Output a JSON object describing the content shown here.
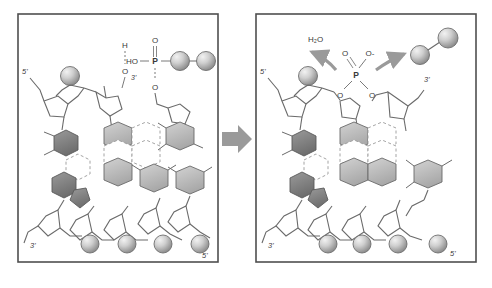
{
  "figure": {
    "type": "diagram",
    "background_color": "#ffffff",
    "panel_border_color": "#4f4f4f",
    "transition_arrow": {
      "name": "reaction-arrow",
      "direction": "right",
      "color": "#9a9a9a"
    }
  },
  "panels": [
    {
      "id": "before",
      "labels": {
        "template_5prime_top": "5'",
        "primer_3prime_oh": "3'",
        "template_3prime_bottom": "3'",
        "strand_5prime_bottom": "5'"
      },
      "hydroxyl": {
        "hydrogen": "H",
        "oxygen": "O"
      },
      "incoming_nucleotide": {
        "hydroxyl_label": "HO",
        "phosphorus": "P",
        "oxygen_double_bond": "O",
        "oxygen_ester": "O",
        "phosphate_spheres": 2
      }
    },
    {
      "id": "after",
      "labels": {
        "template_5prime_top": "5'",
        "new_3prime_end": "3'",
        "template_3prime_bottom": "3'",
        "strand_5prime_bottom": "5'"
      },
      "released_products": {
        "water": "H₂O",
        "pyrophosphate_spheres": 2
      },
      "phosphodiester": {
        "phosphorus": "P",
        "oxygen_double_bond": "O",
        "oxygen_anion": "O-",
        "oxygen_ester_left": "O",
        "oxygen_ester_right": "O"
      },
      "arrows": {
        "water_release": "arrow-to-water",
        "pyrophosphate_release": "arrow-to-pyrophosphate"
      }
    }
  ],
  "legend_colors": {
    "dark_base": "#7d7d7d",
    "light_base": "#b9b9b9",
    "outline": "#555555",
    "sphere_light": "#d8d8d8",
    "sphere_shade": "#8d8d8d",
    "hydrogen_bond": "#9a9a9a",
    "backbone": "#666666",
    "arrow_gray": "#9a9a9a"
  }
}
